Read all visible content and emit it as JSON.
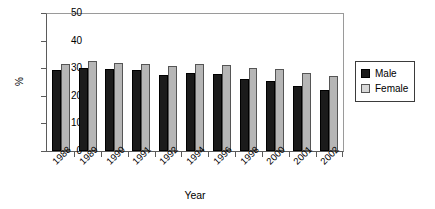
{
  "chart_data": {
    "type": "bar",
    "title": "",
    "xlabel": "Year",
    "ylabel": "%",
    "ylim": [
      0,
      50
    ],
    "yticks": [
      0,
      10,
      20,
      30,
      40,
      50
    ],
    "grid": false,
    "legend_position": "right",
    "categories": [
      "1988",
      "1989",
      "1990",
      "1991",
      "1992",
      "1994",
      "1996",
      "1998",
      "2000",
      "2001",
      "2002"
    ],
    "series": [
      {
        "name": "Male",
        "color": "#1b1b1b",
        "values": [
          29.4,
          30.0,
          29.7,
          29.3,
          27.6,
          28.4,
          27.8,
          26.0,
          25.2,
          23.6,
          22.1
        ]
      },
      {
        "name": "Female",
        "color": "#b6b6b6",
        "values": [
          31.7,
          32.7,
          31.9,
          31.6,
          30.7,
          31.5,
          31.2,
          30.0,
          29.8,
          28.3,
          27.1
        ]
      }
    ]
  },
  "legend": {
    "items": [
      {
        "label": "Male"
      },
      {
        "label": "Female"
      }
    ]
  }
}
